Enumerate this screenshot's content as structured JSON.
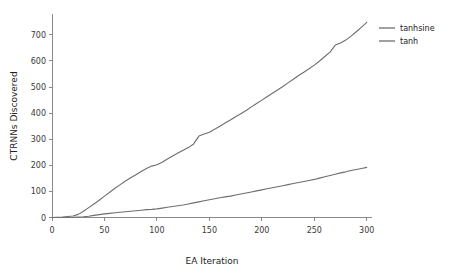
{
  "chart_data": {
    "type": "line",
    "title": "",
    "xlabel": "EA Iteration",
    "ylabel": "CTRNNs Discovered",
    "xlim": [
      0,
      305
    ],
    "ylim": [
      0,
      780
    ],
    "xticks": [
      0,
      50,
      100,
      150,
      200,
      250,
      300
    ],
    "xtick_labels": [
      "0",
      "50",
      "100",
      "150",
      "200",
      "250",
      "300"
    ],
    "yticks": [
      0,
      100,
      200,
      300,
      400,
      500,
      600,
      700
    ],
    "ytick_labels": [
      "0",
      "100",
      "200",
      "300",
      "400",
      "500",
      "600",
      "700"
    ],
    "grid": false,
    "legend_position": "upper right",
    "x": [
      0,
      10,
      20,
      25,
      30,
      35,
      40,
      45,
      50,
      55,
      60,
      65,
      70,
      75,
      80,
      85,
      90,
      95,
      100,
      105,
      110,
      115,
      120,
      125,
      130,
      135,
      140,
      145,
      150,
      155,
      160,
      165,
      170,
      175,
      180,
      185,
      190,
      195,
      200,
      205,
      210,
      215,
      220,
      225,
      230,
      235,
      240,
      245,
      250,
      255,
      260,
      265,
      270,
      275,
      280,
      285,
      290,
      295,
      300
    ],
    "series": [
      {
        "name": "tanhsine",
        "color": "#6e6e6e",
        "values": [
          0,
          2,
          6,
          12,
          24,
          38,
          52,
          66,
          82,
          97,
          112,
          126,
          140,
          152,
          164,
          176,
          188,
          197,
          202,
          212,
          224,
          236,
          247,
          258,
          268,
          282,
          312,
          320,
          327,
          338,
          350,
          362,
          374,
          386,
          398,
          410,
          424,
          437,
          450,
          463,
          476,
          489,
          502,
          516,
          530,
          544,
          557,
          570,
          584,
          600,
          617,
          634,
          661,
          669,
          680,
          695,
          712,
          730,
          748
        ]
      },
      {
        "name": "tanh",
        "color": "#6e6e6e",
        "values": [
          0,
          0,
          1,
          2,
          3,
          5,
          8,
          11,
          14,
          16,
          18,
          20,
          22,
          24,
          26,
          28,
          30,
          31,
          33,
          36,
          39,
          42,
          45,
          48,
          52,
          56,
          60,
          64,
          68,
          72,
          76,
          79,
          82,
          86,
          90,
          94,
          98,
          102,
          106,
          110,
          114,
          118,
          122,
          126,
          130,
          134,
          138,
          142,
          146,
          151,
          156,
          161,
          166,
          171,
          175,
          180,
          184,
          188,
          192
        ]
      }
    ],
    "legend_entries": [
      {
        "label": "tanhsine",
        "color": "#6e6e6e"
      },
      {
        "label": "tanh",
        "color": "#6e6e6e"
      }
    ]
  },
  "colors": {
    "background": "#ffffff",
    "axis": "#8a8a8a",
    "text": "#222222",
    "tick_text": "#3a3a3a",
    "series_tanhsine": "#6e6e6e",
    "series_tanh": "#6e6e6e"
  }
}
